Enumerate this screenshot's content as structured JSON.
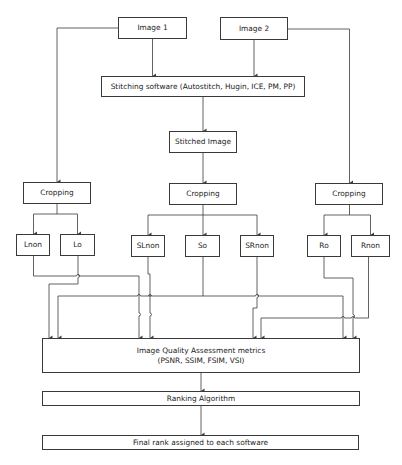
{
  "diagram": {
    "title": "",
    "colors": {
      "line": "#3a3a3a",
      "text": "#222222",
      "background": "#ffffff"
    },
    "nodes": {
      "image1": {
        "label": "Image 1"
      },
      "image2": {
        "label": "Image 2"
      },
      "stitching": {
        "label": "Stitching software (Autostitch, Hugin, ICE, PM, PP)"
      },
      "stitched": {
        "label": "Stitched Image"
      },
      "crop_left": {
        "label": "Cropping"
      },
      "crop_mid": {
        "label": "Cropping"
      },
      "crop_right": {
        "label": "Cropping"
      },
      "lnon": {
        "label": "Lnon"
      },
      "lo": {
        "label": "Lo"
      },
      "slnon": {
        "label": "SLnon"
      },
      "so": {
        "label": "So"
      },
      "srnon": {
        "label": "SRnon"
      },
      "ro": {
        "label": "Ro"
      },
      "rnon": {
        "label": "Rnon"
      },
      "iqa": {
        "label_line1": "Image Quality Assessment metrics",
        "label_line2": "(PSNR, SSIM, FSIM, VSI)"
      },
      "ranking": {
        "label": "Ranking Algorithm"
      },
      "final": {
        "label": "Final rank assigned to each software"
      }
    },
    "edges": [
      {
        "from": "Image 1",
        "to": "Stitching software"
      },
      {
        "from": "Image 2",
        "to": "Stitching software"
      },
      {
        "from": "Image 1",
        "to": "Cropping (left)"
      },
      {
        "from": "Image 2",
        "to": "Cropping (right)"
      },
      {
        "from": "Stitching software",
        "to": "Stitched Image"
      },
      {
        "from": "Stitched Image",
        "to": "Cropping (middle)"
      },
      {
        "from": "Cropping (left)",
        "to": "Lnon"
      },
      {
        "from": "Cropping (left)",
        "to": "Lo"
      },
      {
        "from": "Cropping (middle)",
        "to": "SLnon"
      },
      {
        "from": "Cropping (middle)",
        "to": "So"
      },
      {
        "from": "Cropping (middle)",
        "to": "SRnon"
      },
      {
        "from": "Cropping (right)",
        "to": "Ro"
      },
      {
        "from": "Cropping (right)",
        "to": "Rnon"
      },
      {
        "from": "Lnon",
        "to": "Image Quality Assessment metrics"
      },
      {
        "from": "Lo",
        "to": "Image Quality Assessment metrics"
      },
      {
        "from": "SLnon",
        "to": "Image Quality Assessment metrics"
      },
      {
        "from": "So",
        "to": "Image Quality Assessment metrics"
      },
      {
        "from": "SRnon",
        "to": "Image Quality Assessment metrics"
      },
      {
        "from": "Ro",
        "to": "Image Quality Assessment metrics"
      },
      {
        "from": "Rnon",
        "to": "Image Quality Assessment metrics"
      },
      {
        "from": "Image Quality Assessment metrics",
        "to": "Ranking Algorithm"
      },
      {
        "from": "Ranking Algorithm",
        "to": "Final rank assigned to each software"
      }
    ]
  }
}
